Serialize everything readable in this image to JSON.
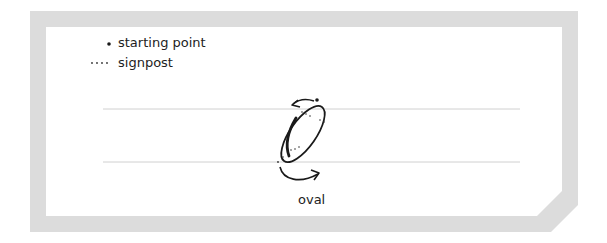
{
  "legend": {
    "items": [
      {
        "symbol": "starting-point-dot",
        "label": "starting point"
      },
      {
        "symbol": "signpost-dots",
        "label": "signpost"
      }
    ]
  },
  "letter": {
    "glyph": "O",
    "caption": "oval"
  },
  "colors": {
    "frame": "#d9d9d9",
    "guide_line": "#cfcfcf",
    "ink": "#1a1a1a",
    "text": "#222222"
  }
}
